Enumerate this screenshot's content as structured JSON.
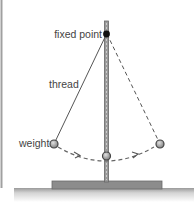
{
  "diagram": {
    "type": "pendulum",
    "labels": {
      "fixed_point": "fixed point",
      "thread": "thread",
      "weight": "weight"
    },
    "colors": {
      "line": "#555555",
      "stand": "#8a8a8a",
      "base": "#7a7a7a",
      "ground": "#c8c8c8",
      "bob_fill": "#9a9a9a",
      "bob_stroke": "#444444",
      "fixed_point": "#111111",
      "frame": "#999999"
    }
  }
}
